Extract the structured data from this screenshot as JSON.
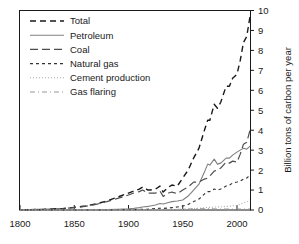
{
  "chart_data": {
    "type": "line",
    "title": "",
    "xlabel": "",
    "ylabel": "Billion tons of carbon per year",
    "xlim": [
      1800,
      2012
    ],
    "ylim": [
      0,
      10
    ],
    "xticks": [
      1800,
      1850,
      1900,
      1950,
      2000
    ],
    "xtick_labels": [
      "1800",
      "1850",
      "1900",
      "1950",
      "2000"
    ],
    "yticks": [
      0,
      1,
      2,
      3,
      4,
      5,
      6,
      7,
      8,
      9,
      10
    ],
    "ytick_labels": [
      "0",
      "1",
      "2",
      "3",
      "4",
      "5",
      "6",
      "7",
      "8",
      "9",
      "10"
    ],
    "y_axis_side": "right",
    "grid": false,
    "legend_position": "upper-left",
    "x": [
      1800,
      1810,
      1820,
      1830,
      1840,
      1850,
      1860,
      1870,
      1880,
      1890,
      1900,
      1905,
      1910,
      1913,
      1918,
      1920,
      1925,
      1929,
      1932,
      1937,
      1940,
      1945,
      1950,
      1955,
      1960,
      1965,
      1970,
      1973,
      1975,
      1979,
      1982,
      1985,
      1990,
      1993,
      1996,
      2000,
      2003,
      2006,
      2009,
      2012
    ],
    "series": [
      {
        "name": "Total",
        "dash": "6,4",
        "color": "#1a1a1a",
        "width": 1.4,
        "values": [
          0.01,
          0.02,
          0.03,
          0.05,
          0.08,
          0.13,
          0.2,
          0.3,
          0.45,
          0.65,
          0.85,
          0.95,
          1.05,
          1.15,
          1.0,
          1.0,
          1.05,
          1.2,
          0.9,
          1.15,
          1.25,
          1.2,
          1.6,
          2.0,
          2.6,
          3.1,
          4.0,
          4.5,
          4.5,
          5.3,
          5.1,
          5.4,
          6.2,
          6.2,
          6.6,
          6.8,
          7.5,
          8.4,
          8.7,
          9.7
        ]
      },
      {
        "name": "Petroleum",
        "dash": "none",
        "color": "#808080",
        "width": 1.1,
        "values": [
          0.0,
          0.0,
          0.0,
          0.0,
          0.0,
          0.0,
          0.0,
          0.01,
          0.02,
          0.04,
          0.06,
          0.08,
          0.12,
          0.15,
          0.18,
          0.2,
          0.25,
          0.33,
          0.3,
          0.38,
          0.42,
          0.45,
          0.5,
          0.7,
          1.0,
          1.3,
          1.9,
          2.3,
          2.25,
          2.55,
          2.3,
          2.35,
          2.6,
          2.6,
          2.75,
          2.9,
          3.0,
          3.1,
          3.05,
          3.2
        ]
      },
      {
        "name": "Coal",
        "dash": "8,4",
        "color": "#4d4d4d",
        "width": 1.2,
        "values": [
          0.01,
          0.02,
          0.03,
          0.05,
          0.07,
          0.12,
          0.18,
          0.28,
          0.42,
          0.58,
          0.75,
          0.85,
          0.92,
          1.0,
          0.85,
          0.85,
          0.85,
          0.95,
          0.68,
          0.85,
          0.9,
          0.82,
          1.0,
          1.15,
          1.4,
          1.4,
          1.55,
          1.6,
          1.7,
          1.95,
          2.0,
          2.1,
          2.4,
          2.35,
          2.45,
          2.4,
          2.8,
          3.3,
          3.4,
          4.0
        ]
      },
      {
        "name": "Natural gas",
        "dash": "3,3",
        "color": "#333333",
        "width": 1.1,
        "values": [
          0.0,
          0.0,
          0.0,
          0.0,
          0.0,
          0.0,
          0.0,
          0.0,
          0.0,
          0.01,
          0.02,
          0.02,
          0.03,
          0.04,
          0.04,
          0.05,
          0.07,
          0.09,
          0.08,
          0.1,
          0.12,
          0.15,
          0.2,
          0.28,
          0.42,
          0.55,
          0.8,
          0.92,
          0.92,
          1.05,
          1.0,
          1.05,
          1.2,
          1.25,
          1.35,
          1.4,
          1.45,
          1.55,
          1.6,
          1.75
        ]
      },
      {
        "name": "Cement production",
        "dash": "1,2",
        "color": "#a8a8a8",
        "width": 1.1,
        "values": [
          0.0,
          0.0,
          0.0,
          0.0,
          0.0,
          0.0,
          0.0,
          0.0,
          0.0,
          0.0,
          0.0,
          0.0,
          0.01,
          0.01,
          0.01,
          0.01,
          0.02,
          0.02,
          0.02,
          0.03,
          0.03,
          0.02,
          0.03,
          0.05,
          0.07,
          0.09,
          0.11,
          0.13,
          0.13,
          0.15,
          0.15,
          0.16,
          0.18,
          0.19,
          0.21,
          0.23,
          0.29,
          0.36,
          0.41,
          0.5
        ]
      },
      {
        "name": "Gas flaring",
        "dash": "5,3,1,3",
        "color": "#999999",
        "width": 1.0,
        "values": [
          0.0,
          0.0,
          0.0,
          0.0,
          0.0,
          0.0,
          0.0,
          0.0,
          0.0,
          0.0,
          0.0,
          0.0,
          0.0,
          0.0,
          0.0,
          0.01,
          0.01,
          0.02,
          0.02,
          0.02,
          0.03,
          0.03,
          0.04,
          0.05,
          0.06,
          0.06,
          0.07,
          0.07,
          0.07,
          0.06,
          0.05,
          0.05,
          0.05,
          0.05,
          0.05,
          0.05,
          0.05,
          0.05,
          0.05,
          0.05
        ]
      }
    ]
  },
  "legend": {
    "items": [
      {
        "label": "Total"
      },
      {
        "label": "Petroleum"
      },
      {
        "label": "Coal"
      },
      {
        "label": "Natural gas"
      },
      {
        "label": "Cement production"
      },
      {
        "label": "Gas flaring"
      }
    ]
  }
}
